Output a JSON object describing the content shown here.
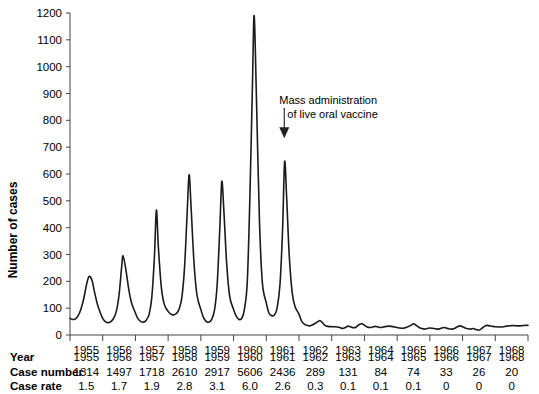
{
  "chart_data": {
    "type": "line",
    "title": "",
    "xlabel": "",
    "ylabel": "Number of cases",
    "ylim": [
      0,
      1200
    ],
    "yticks": [
      0,
      100,
      200,
      300,
      400,
      500,
      600,
      700,
      800,
      900,
      1000,
      1100,
      1200
    ],
    "xlim": [
      1955,
      1969
    ],
    "xticks": [
      1955,
      1956,
      1957,
      1958,
      1959,
      1960,
      1961,
      1962,
      1963,
      1964,
      1965,
      1966,
      1967,
      1968,
      1969
    ],
    "xtick_labels": [
      "1955",
      "1956",
      "1957",
      "1958",
      "1959",
      "1960",
      "1961",
      "1962",
      "1963",
      "1964",
      "1965",
      "1966",
      "1967",
      "1968"
    ],
    "grid": false,
    "legend": "none",
    "line_color": "#1a1a1a",
    "annotations": [
      {
        "text_line1": "Mass administration",
        "text_line2": "of live oral vaccine",
        "arrow": "down-arrow",
        "points_to_year": 1961.55,
        "points_to_value": 700
      }
    ],
    "series": [
      {
        "name": "Number of cases",
        "points": [
          [
            1955.0,
            62
          ],
          [
            1955.08,
            58
          ],
          [
            1955.17,
            60
          ],
          [
            1955.25,
            72
          ],
          [
            1955.33,
            95
          ],
          [
            1955.42,
            135
          ],
          [
            1955.5,
            185
          ],
          [
            1955.58,
            218
          ],
          [
            1955.67,
            205
          ],
          [
            1955.75,
            160
          ],
          [
            1955.83,
            118
          ],
          [
            1955.92,
            85
          ],
          [
            1956.0,
            62
          ],
          [
            1956.08,
            50
          ],
          [
            1956.17,
            46
          ],
          [
            1956.25,
            50
          ],
          [
            1956.33,
            62
          ],
          [
            1956.42,
            90
          ],
          [
            1956.5,
            150
          ],
          [
            1956.58,
            255
          ],
          [
            1956.62,
            295
          ],
          [
            1956.7,
            250
          ],
          [
            1956.79,
            175
          ],
          [
            1956.88,
            120
          ],
          [
            1957.0,
            82
          ],
          [
            1957.08,
            60
          ],
          [
            1957.17,
            50
          ],
          [
            1957.25,
            48
          ],
          [
            1957.33,
            55
          ],
          [
            1957.42,
            78
          ],
          [
            1957.5,
            140
          ],
          [
            1957.58,
            290
          ],
          [
            1957.64,
            465
          ],
          [
            1957.7,
            330
          ],
          [
            1957.79,
            180
          ],
          [
            1957.88,
            115
          ],
          [
            1958.0,
            88
          ],
          [
            1958.08,
            78
          ],
          [
            1958.17,
            75
          ],
          [
            1958.25,
            80
          ],
          [
            1958.33,
            95
          ],
          [
            1958.42,
            140
          ],
          [
            1958.5,
            250
          ],
          [
            1958.58,
            450
          ],
          [
            1958.64,
            597
          ],
          [
            1958.7,
            480
          ],
          [
            1958.79,
            270
          ],
          [
            1958.88,
            150
          ],
          [
            1959.0,
            95
          ],
          [
            1959.08,
            65
          ],
          [
            1959.17,
            50
          ],
          [
            1959.25,
            48
          ],
          [
            1959.33,
            58
          ],
          [
            1959.42,
            95
          ],
          [
            1959.5,
            190
          ],
          [
            1959.58,
            400
          ],
          [
            1959.64,
            572
          ],
          [
            1959.7,
            470
          ],
          [
            1959.79,
            265
          ],
          [
            1959.88,
            145
          ],
          [
            1960.0,
            95
          ],
          [
            1960.08,
            70
          ],
          [
            1960.17,
            58
          ],
          [
            1960.25,
            62
          ],
          [
            1960.33,
            95
          ],
          [
            1960.42,
            200
          ],
          [
            1960.5,
            520
          ],
          [
            1960.58,
            950
          ],
          [
            1960.63,
            1190
          ],
          [
            1960.7,
            880
          ],
          [
            1960.79,
            430
          ],
          [
            1960.88,
            195
          ],
          [
            1961.0,
            120
          ],
          [
            1961.08,
            82
          ],
          [
            1961.17,
            72
          ],
          [
            1961.25,
            75
          ],
          [
            1961.33,
            100
          ],
          [
            1961.42,
            190
          ],
          [
            1961.5,
            400
          ],
          [
            1961.56,
            645
          ],
          [
            1961.62,
            520
          ],
          [
            1961.7,
            300
          ],
          [
            1961.79,
            160
          ],
          [
            1961.88,
            105
          ],
          [
            1962.0,
            78
          ],
          [
            1962.08,
            52
          ],
          [
            1962.17,
            40
          ],
          [
            1962.25,
            36
          ],
          [
            1962.33,
            34
          ],
          [
            1962.42,
            38
          ],
          [
            1962.5,
            44
          ],
          [
            1962.58,
            50
          ],
          [
            1962.64,
            54
          ],
          [
            1962.7,
            48
          ],
          [
            1962.79,
            36
          ],
          [
            1962.88,
            32
          ],
          [
            1963.0,
            31
          ],
          [
            1963.08,
            31
          ],
          [
            1963.17,
            30
          ],
          [
            1963.25,
            28
          ],
          [
            1963.33,
            24
          ],
          [
            1963.42,
            28
          ],
          [
            1963.5,
            33
          ],
          [
            1963.58,
            30
          ],
          [
            1963.67,
            27
          ],
          [
            1963.75,
            30
          ],
          [
            1963.83,
            38
          ],
          [
            1963.92,
            42
          ],
          [
            1964.0,
            36
          ],
          [
            1964.08,
            30
          ],
          [
            1964.17,
            28
          ],
          [
            1964.25,
            30
          ],
          [
            1964.33,
            32
          ],
          [
            1964.42,
            30
          ],
          [
            1964.5,
            28
          ],
          [
            1964.58,
            30
          ],
          [
            1964.67,
            32
          ],
          [
            1964.75,
            33
          ],
          [
            1964.83,
            32
          ],
          [
            1964.92,
            30
          ],
          [
            1965.0,
            28
          ],
          [
            1965.08,
            26
          ],
          [
            1965.17,
            25
          ],
          [
            1965.25,
            27
          ],
          [
            1965.33,
            31
          ],
          [
            1965.42,
            36
          ],
          [
            1965.5,
            42
          ],
          [
            1965.58,
            36
          ],
          [
            1965.67,
            28
          ],
          [
            1965.75,
            24
          ],
          [
            1965.83,
            22
          ],
          [
            1965.92,
            24
          ],
          [
            1966.0,
            26
          ],
          [
            1966.08,
            25
          ],
          [
            1966.17,
            23
          ],
          [
            1966.25,
            22
          ],
          [
            1966.33,
            24
          ],
          [
            1966.42,
            28
          ],
          [
            1966.5,
            26
          ],
          [
            1966.58,
            23
          ],
          [
            1966.67,
            22
          ],
          [
            1966.75,
            24
          ],
          [
            1966.83,
            30
          ],
          [
            1966.92,
            34
          ],
          [
            1967.0,
            31
          ],
          [
            1967.08,
            26
          ],
          [
            1967.17,
            23
          ],
          [
            1967.25,
            22
          ],
          [
            1967.33,
            24
          ],
          [
            1967.42,
            20
          ],
          [
            1967.5,
            18
          ],
          [
            1967.58,
            24
          ],
          [
            1967.67,
            32
          ],
          [
            1967.75,
            36
          ],
          [
            1967.83,
            34
          ],
          [
            1967.92,
            32
          ],
          [
            1968.0,
            31
          ],
          [
            1968.08,
            30
          ],
          [
            1968.17,
            30
          ],
          [
            1968.25,
            31
          ],
          [
            1968.33,
            33
          ],
          [
            1968.42,
            34
          ],
          [
            1968.5,
            35
          ],
          [
            1968.58,
            35
          ],
          [
            1968.67,
            34
          ],
          [
            1968.75,
            34
          ],
          [
            1968.83,
            35
          ],
          [
            1968.92,
            36
          ],
          [
            1969.0,
            36
          ]
        ]
      }
    ]
  },
  "table": {
    "row_labels": [
      "Year",
      "Case number",
      "Case rate"
    ],
    "years": [
      "1955",
      "1956",
      "1957",
      "1958",
      "1959",
      "1960",
      "1961",
      "1962",
      "1963",
      "1964",
      "1965",
      "1966",
      "1967",
      "1968"
    ],
    "case_number": [
      "1314",
      "1497",
      "1718",
      "2610",
      "2917",
      "5606",
      "2436",
      "289",
      "131",
      "84",
      "74",
      "33",
      "26",
      "20"
    ],
    "case_rate": [
      "1.5",
      "1.7",
      "1.9",
      "2.8",
      "3.1",
      "6.0",
      "2.6",
      "0.3",
      "0.1",
      "0.1",
      "0.1",
      "0",
      "0",
      "0"
    ]
  }
}
